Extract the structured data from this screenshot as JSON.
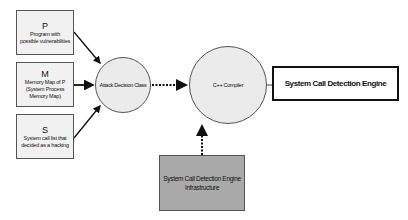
{
  "diagram": {
    "inputs": [
      {
        "letter": "P",
        "line1": "Program with",
        "line2": "possible vulnerabilities",
        "line3": ""
      },
      {
        "letter": "M",
        "line1": "Memory Map of P",
        "line2": "(System Process",
        "line3": "Memory Map)"
      },
      {
        "letter": "S",
        "line1": "System call list that",
        "line2": "decided as a hacking",
        "line3": ""
      }
    ],
    "attack_decision": "Attack Decision Class",
    "compiler": "C++ Compiler",
    "engine": "System Call Detection Engine",
    "infrastructure": {
      "line1": "System Call Detection Engine",
      "line2": "Infrastructure"
    },
    "colors": {
      "input_fill": "#f1f1f1",
      "circle_fill": "#ebebeb",
      "infra_fill": "#a9a9a9",
      "stroke": "#111111"
    }
  }
}
